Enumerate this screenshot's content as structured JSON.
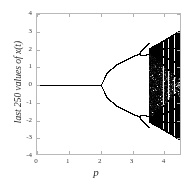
{
  "chart_data": {
    "type": "scatter",
    "title": "",
    "subtitle": "",
    "xlabel": "p",
    "ylabel": "last 250 values of x(t)",
    "xlim": [
      0,
      4.55
    ],
    "ylim": [
      -4,
      4
    ],
    "xticks": [
      0,
      1,
      2,
      3,
      4
    ],
    "xticklabels": [
      "0",
      "1",
      "2",
      "3",
      "4"
    ],
    "yticks": [
      4,
      3,
      2,
      1,
      0,
      -1,
      -2,
      -3,
      -4
    ],
    "yticklabels": [
      "4",
      "3",
      "2",
      "1",
      "0",
      "-1",
      "-2",
      "-3",
      "-4"
    ],
    "grid": false,
    "legend": null,
    "point_color": "#000000",
    "frame_color": "#b9b9b9",
    "regimes": [
      {
        "name": "fixed-point",
        "p_range": [
          0.0,
          2.0
        ],
        "branches": 1,
        "values": [
          0
        ]
      },
      {
        "name": "period-2",
        "p_range": [
          2.0,
          3.22
        ],
        "branches": 2
      },
      {
        "name": "period-4",
        "p_range": [
          3.22,
          3.5
        ],
        "branches": 4
      },
      {
        "name": "chaos",
        "p_range": [
          3.5,
          4.55
        ],
        "branches": "many"
      }
    ],
    "bifurcation_points": [
      {
        "p": 2.0,
        "type": "pitchfork",
        "x": 0
      },
      {
        "p": 3.22,
        "type": "period-doubling"
      },
      {
        "p": 3.5,
        "type": "onset-of-chaos"
      }
    ],
    "envelope": {
      "comment": "upper branch amplitude A(p) ~ sqrt-like growth from p=2",
      "x_at_p": [
        {
          "p": 2.0,
          "x_upper": 0.0
        },
        {
          "p": 2.2,
          "x_upper": 0.72
        },
        {
          "p": 2.5,
          "x_upper": 1.18
        },
        {
          "p": 3.0,
          "x_upper": 1.62
        },
        {
          "p": 3.22,
          "x_upper": 1.78
        },
        {
          "p": 3.5,
          "x_upper": 2.05
        },
        {
          "p": 4.0,
          "x_upper": 2.55
        },
        {
          "p": 4.55,
          "x_upper": 3.15
        }
      ]
    },
    "periodic_windows_p": [
      3.95,
      4.12,
      4.3,
      4.44
    ]
  },
  "axes": {
    "x_title": "p",
    "y_title": "last 250 values of x(t)"
  }
}
